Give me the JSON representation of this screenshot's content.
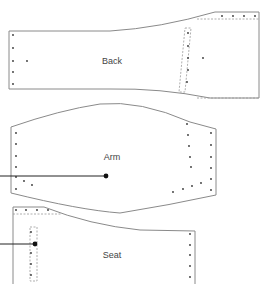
{
  "diagram": {
    "type": "sewing-pattern",
    "pieces": [
      {
        "id": "back",
        "label": "Back",
        "label_pos": [
          112,
          61
        ]
      },
      {
        "id": "arm",
        "label": "Arm",
        "label_pos": [
          112,
          62
        ]
      },
      {
        "id": "seat",
        "label": "Seat",
        "label_pos": [
          112,
          60
        ]
      }
    ],
    "colors": {
      "outline": "#8a8a8a",
      "dashed_seam": "#9a9a9a",
      "markers": "#333333",
      "leader_line": "#222222"
    }
  }
}
